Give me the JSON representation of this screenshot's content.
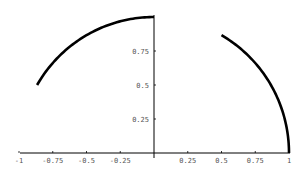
{
  "chart_data": {
    "type": "line",
    "title": "",
    "xlabel": "",
    "ylabel": "",
    "xlim": [
      -1,
      1
    ],
    "ylim": [
      0,
      1
    ],
    "grid": false,
    "legend": null,
    "x_ticks": [
      "-1",
      "-0.75",
      "-0.5",
      "-0.25",
      "0.25",
      "0.5",
      "0.75",
      "1"
    ],
    "y_ticks": [
      "0.25",
      "0.5",
      "0.75"
    ],
    "series": [
      {
        "name": "arc-left",
        "description": "unit circle arc from angle 90deg to 150deg",
        "angle_range_deg": [
          90,
          150
        ],
        "points": [
          [
            0,
            1
          ],
          [
            -0.26,
            0.97
          ],
          [
            -0.5,
            0.87
          ],
          [
            -0.71,
            0.71
          ],
          [
            -0.87,
            0.5
          ]
        ]
      },
      {
        "name": "arc-right",
        "description": "unit circle arc from angle 0deg to 60deg",
        "angle_range_deg": [
          0,
          60
        ],
        "points": [
          [
            1,
            0
          ],
          [
            0.97,
            0.26
          ],
          [
            0.87,
            0.5
          ],
          [
            0.71,
            0.71
          ],
          [
            0.5,
            0.87
          ]
        ]
      }
    ],
    "colors": {
      "curve": "#000000",
      "axis": "#000000",
      "text": "#555555"
    }
  }
}
